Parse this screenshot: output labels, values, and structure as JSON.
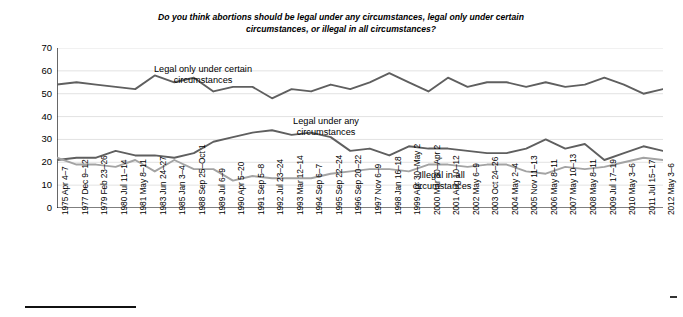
{
  "chart_data": {
    "type": "line",
    "title": "Do you think abortions should be legal under any circumstances, legal only under certain circumstances, or illegal in all circumstances?",
    "xlabel": "",
    "ylabel": "",
    "ylim": [
      0,
      70
    ],
    "yticks": [
      0,
      10,
      20,
      30,
      40,
      50,
      60,
      70
    ],
    "grid": true,
    "legend_position": "inline-annotations",
    "categories": [
      "1975 Apr 4–7",
      "1977 Dec 9–12",
      "1979 Feb 23–26",
      "1980 Jul 11–14",
      "1981 May 8–11",
      "1983 Jun 24–27",
      "1985 Jan 3–4",
      "1988 Sep 25–Oct 1",
      "1989 Jul 6–9",
      "1990 Apr 5–20",
      "1991 Sep 5–8",
      "1992 Jul 23–24",
      "1993 Mar 12–14",
      "1994 Sep 6–7",
      "1995 Sep 22–24",
      "1996 Sep 20–22",
      "1997 Nov 6–9",
      "1998 Jan 16–18",
      "1999 Apr 30–May 2",
      "2000 Mar 30–Apr 2",
      "2001 Aug 10–12",
      "2002 May 6–9",
      "2003 Oct 24–26",
      "2004 May 2–4",
      "2005 Nov 11–13",
      "2006 May 8–11",
      "2007 May 10–13",
      "2008 May 8–11",
      "2009 Jul 17–19",
      "2010 May 3–6",
      "2011 Jul 15–17",
      "2012 May 3–6"
    ],
    "series": [
      {
        "name": "Legal only under certain circumstances",
        "color": "#5f5f5f",
        "values": [
          54,
          55,
          54,
          53,
          52,
          58,
          55,
          57,
          51,
          53,
          53,
          48,
          52,
          51,
          54,
          52,
          55,
          59,
          55,
          51,
          57,
          53,
          55,
          55,
          53,
          55,
          53,
          54,
          57,
          54,
          50,
          52
        ]
      },
      {
        "name": "Legal under any circumstances",
        "color": "#5f5f5f",
        "values": [
          21,
          22,
          22,
          25,
          23,
          23,
          22,
          24,
          29,
          31,
          33,
          34,
          32,
          33,
          31,
          25,
          26,
          23,
          27,
          26,
          26,
          25,
          24,
          24,
          26,
          30,
          26,
          28,
          21,
          24,
          27,
          25
        ]
      },
      {
        "name": "Illegal in all circumstances",
        "color": "#a3a3a3",
        "values": [
          22,
          19,
          19,
          18,
          21,
          16,
          21,
          17,
          17,
          12,
          14,
          13,
          13,
          13,
          15,
          16,
          17,
          17,
          16,
          19,
          19,
          18,
          19,
          19,
          16,
          15,
          18,
          17,
          18,
          20,
          22,
          21
        ]
      }
    ],
    "annotations": [
      {
        "id": "certain",
        "text": "Legal only under certain\ncircumstances"
      },
      {
        "id": "any",
        "text": "Legal under any\ncircumstances"
      },
      {
        "id": "illegal",
        "text": "Illegal in all\ncircumstances"
      }
    ]
  }
}
